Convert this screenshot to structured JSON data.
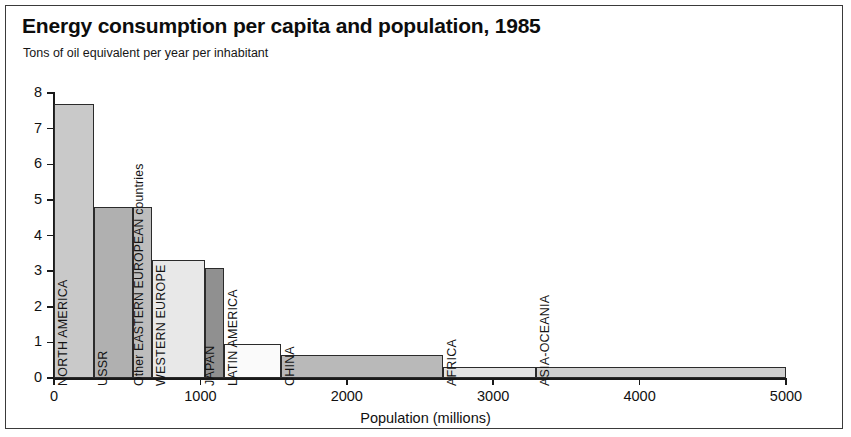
{
  "header": {
    "title": "Energy consumption per capita and population, 1985",
    "subtitle": "Tons of oil equivalent per year per inhabitant"
  },
  "axes": {
    "x_title": "Population (millions)",
    "x_ticks": [
      "0",
      "1000",
      "2000",
      "3000",
      "4000",
      "5000"
    ],
    "y_ticks": [
      "0",
      "1",
      "2",
      "3",
      "4",
      "5",
      "6",
      "7",
      "8"
    ]
  },
  "chart_data": {
    "type": "bar",
    "title": "Energy consumption per capita and population, 1985",
    "subtitle": "Tons of oil equivalent per year per inhabitant",
    "xlabel": "Population (millions)",
    "ylabel": "Tons of oil equivalent per year per inhabitant",
    "xlim": [
      0,
      5000
    ],
    "ylim": [
      0,
      8
    ],
    "xticks": [
      0,
      1000,
      2000,
      3000,
      4000,
      5000
    ],
    "yticks": [
      0,
      1,
      2,
      3,
      4,
      5,
      6,
      7,
      8
    ],
    "grid": false,
    "legend": "none",
    "note": "Variable-width (Marimekko style) bar chart: bar width = population (millions), bar height = tons of oil equivalent per capita.",
    "categories": [
      "NORTH AMERICA",
      "USSR",
      "Other EASTERN EUROPEAN countries",
      "WESTERN EUROPE",
      "JAPAN",
      "LATIN AMERICA",
      "CHINA",
      "AFRICA",
      "ASIA-OCEANIA"
    ],
    "bars": [
      {
        "label": "NORTH AMERICA",
        "x_start": 0,
        "x_end": 270,
        "width": 270,
        "value": 7.7,
        "color": "#c9c9c9"
      },
      {
        "label": "USSR",
        "x_start": 270,
        "x_end": 540,
        "width": 270,
        "value": 4.8,
        "color": "#b0b0b0"
      },
      {
        "label": "Other EASTERN EUROPEAN countries",
        "x_start": 540,
        "x_end": 670,
        "width": 130,
        "value": 4.8,
        "color": "#bdbdbd"
      },
      {
        "label": "WESTERN EUROPE",
        "x_start": 670,
        "x_end": 1030,
        "width": 360,
        "value": 3.3,
        "color": "#e8e8e8"
      },
      {
        "label": "JAPAN",
        "x_start": 1030,
        "x_end": 1160,
        "width": 130,
        "value": 3.1,
        "color": "#909090"
      },
      {
        "label": "LATIN AMERICA",
        "x_start": 1160,
        "x_end": 1550,
        "width": 390,
        "value": 0.95,
        "color": "#fafafa"
      },
      {
        "label": "CHINA",
        "x_start": 1550,
        "x_end": 2660,
        "width": 1110,
        "value": 0.65,
        "color": "#b9b9b9"
      },
      {
        "label": "AFRICA",
        "x_start": 2660,
        "x_end": 3290,
        "width": 630,
        "value": 0.3,
        "color": "#e3e3e3"
      },
      {
        "label": "ASIA-OCEANIA",
        "x_start": 3290,
        "x_end": 5000,
        "width": 1710,
        "value": 0.3,
        "color": "#cfcfcf"
      }
    ]
  }
}
